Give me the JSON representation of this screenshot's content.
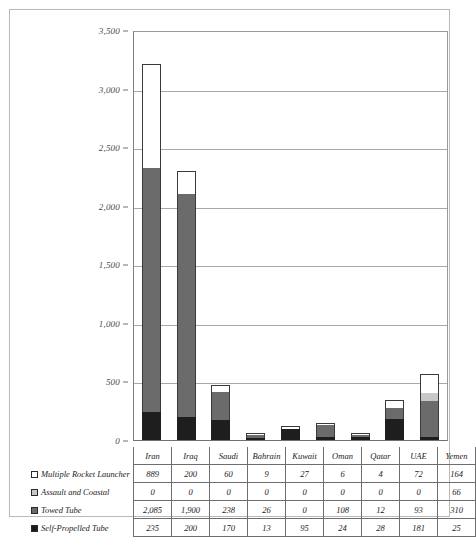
{
  "chart_data": {
    "type": "bar",
    "stacked": true,
    "title": "",
    "xlabel": "",
    "ylabel": "",
    "ylim": [
      0,
      3500
    ],
    "yticks": [
      "0",
      "500",
      "1,000",
      "1,500",
      "2,000",
      "2,500",
      "3,000",
      "3,500"
    ],
    "ytick_values": [
      0,
      500,
      1000,
      1500,
      2000,
      2500,
      3000,
      3500
    ],
    "grid": true,
    "legend_position": "table-left",
    "categories": [
      "Iran",
      "Iraq",
      "Saudi",
      "Bahrain",
      "Kuwait",
      "Oman",
      "Qatar",
      "UAE",
      "Yemen"
    ],
    "series": [
      {
        "name": "Multiple Rocket Launcher",
        "swatch": "sw-mrl",
        "color": "#ffffff",
        "values": [
          889,
          200,
          60,
          9,
          27,
          6,
          4,
          72,
          164
        ],
        "labels": [
          "889",
          "200",
          "60",
          "9",
          "27",
          "6",
          "4",
          "72",
          "164"
        ]
      },
      {
        "name": "Assault and Coastal",
        "swatch": "sw-assault",
        "color": "#c6c6c6",
        "values": [
          0,
          0,
          0,
          0,
          0,
          0,
          0,
          0,
          66
        ],
        "labels": [
          "0",
          "0",
          "0",
          "0",
          "0",
          "0",
          "0",
          "0",
          "66"
        ]
      },
      {
        "name": "Towed Tube",
        "swatch": "sw-towed",
        "color": "#6b6b6b",
        "values": [
          2085,
          1900,
          238,
          26,
          0,
          108,
          12,
          93,
          310
        ],
        "labels": [
          "2,085",
          "1,900",
          "238",
          "26",
          "0",
          "108",
          "12",
          "93",
          "310"
        ]
      },
      {
        "name": "Self-Propelled Tube",
        "swatch": "sw-sp",
        "color": "#1a1a1a",
        "values": [
          235,
          200,
          170,
          13,
          95,
          24,
          28,
          181,
          25
        ],
        "labels": [
          "235",
          "200",
          "170",
          "13",
          "95",
          "24",
          "28",
          "181",
          "25"
        ]
      }
    ],
    "totals": [
      3209,
      2300,
      468,
      48,
      122,
      138,
      44,
      346,
      565
    ]
  }
}
